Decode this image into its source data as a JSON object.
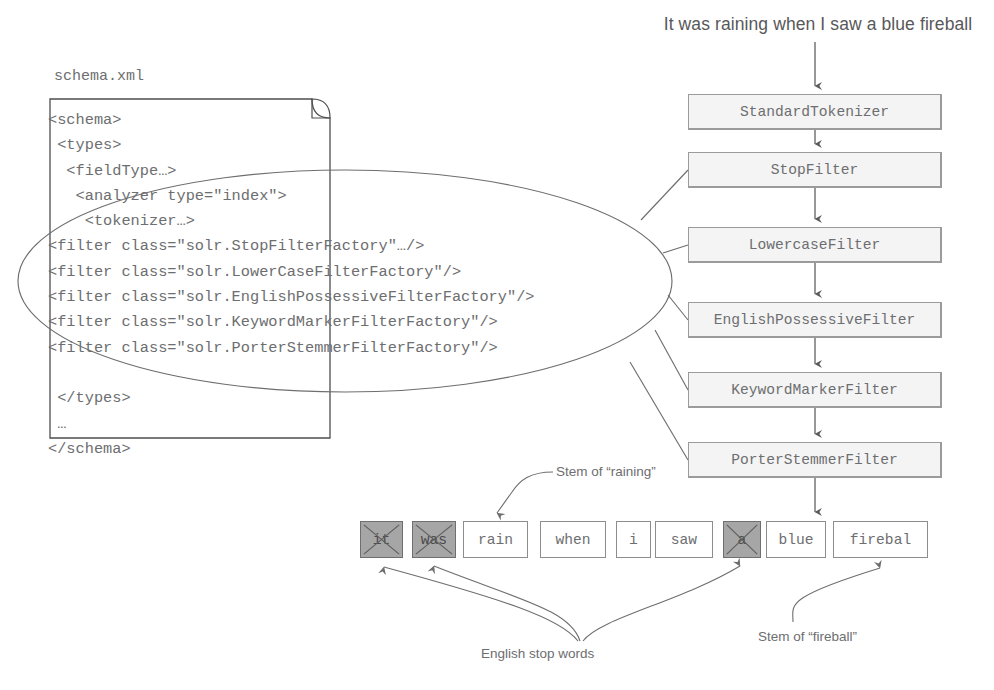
{
  "input": {
    "sentence": "It was raining when I saw a blue fireball"
  },
  "schema_doc": {
    "caption": "schema.xml",
    "lines": [
      "<schema>",
      " <types>",
      "  <fieldType…>",
      "   <analyzer type=\"index\">",
      "    <tokenizer…>",
      "<filter class=\"solr.StopFilterFactory\"…/>",
      "<filter class=\"solr.LowerCaseFilterFactory\"/>",
      "<filter class=\"solr.EnglishPossessiveFilterFactory\"/>",
      "<filter class=\"solr.KeywordMarkerFilterFactory\"/>",
      "<filter class=\"solr.PorterStemmerFilterFactory\"/>",
      "",
      " </types>",
      " …",
      "</schema>"
    ]
  },
  "pipeline": {
    "stages": [
      {
        "label": "StandardTokenizer",
        "top": 94
      },
      {
        "label": "StopFilter",
        "top": 152
      },
      {
        "label": "LowercaseFilter",
        "top": 227
      },
      {
        "label": "EnglishPossessiveFilter",
        "top": 302
      },
      {
        "label": "KeywordMarkerFilter",
        "top": 372
      },
      {
        "label": "PorterStemmerFilter",
        "top": 442
      }
    ]
  },
  "tokens": [
    {
      "text": "it",
      "left": 360,
      "width": 43,
      "removed": true
    },
    {
      "text": "was",
      "left": 412,
      "width": 44,
      "removed": true
    },
    {
      "text": "rain",
      "left": 463,
      "width": 65,
      "removed": false
    },
    {
      "text": "when",
      "left": 540,
      "width": 66,
      "removed": false
    },
    {
      "text": "i",
      "left": 616,
      "width": 35,
      "removed": false
    },
    {
      "text": "saw",
      "left": 655,
      "width": 58,
      "removed": false
    },
    {
      "text": "a",
      "left": 723,
      "width": 38,
      "removed": true
    },
    {
      "text": "blue",
      "left": 766,
      "width": 60,
      "removed": false
    },
    {
      "text": "firebal",
      "left": 833,
      "width": 95,
      "removed": false
    }
  ],
  "annotations": {
    "stem_raining": "Stem of “raining”",
    "stem_fireball": "Stem of “fireball”",
    "stop_words": "English stop words"
  },
  "colors": {
    "text": "#6d6e70",
    "sentence_text": "#58585a",
    "stage_fill": "#f4f4f4",
    "stage_border": "#9b9b9b",
    "token_border": "#8d8d8d",
    "token_removed_fill": "#a6a6a6",
    "line": "#6d6e70",
    "background": "#ffffff"
  }
}
